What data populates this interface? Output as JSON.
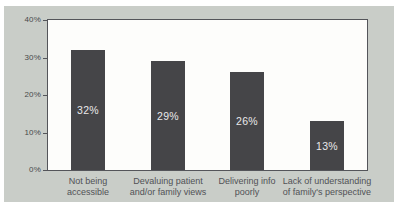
{
  "colors": {
    "page_bg": "#ffffff",
    "card_bg": "#c9cdc8",
    "plot_bg": "#fdfdfb",
    "plot_border": "#54555a",
    "bar_fill": "#454548",
    "bar_value_text": "#e9e9eb",
    "axis_tick_text": "#48494b",
    "category_text": "#515256"
  },
  "chart_data": {
    "type": "bar",
    "title": "",
    "xlabel": "",
    "ylabel": "",
    "categories": [
      "Not being\naccessible",
      "Devaluing patient\nand/or family views",
      "Delivering info\npoorly",
      "Lack of understanding\nof family's perspective"
    ],
    "values": [
      32,
      29,
      26,
      13
    ],
    "data_labels": [
      "32%",
      "29%",
      "26%",
      "13%"
    ],
    "ylim": [
      0,
      40
    ],
    "yticks": [
      0,
      10,
      20,
      30,
      40
    ],
    "ytick_labels": [
      "0%",
      "10%",
      "20%",
      "30%",
      "40%"
    ],
    "grid": false,
    "legend": false,
    "bar_width_px": 34
  }
}
